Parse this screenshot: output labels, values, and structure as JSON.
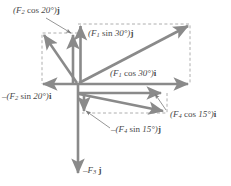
{
  "figure": {
    "colors": {
      "vector": "#8a8a8a",
      "dashed": "#9a9a9a",
      "text": "#4a4a4a",
      "background": "#ffffff"
    }
  },
  "labels": {
    "f2_cos20_j": "(F2 cos 20°)j",
    "f1_sin30_j": "(F1 sin 30°)j",
    "f1_cos30_i": "(F1 cos 30°)i",
    "f2_sin20_i": "–(F2 sin 20°)i",
    "f4_cos15_i": "(F4 cos 15°)i",
    "f4_sin15_j": "–(F4 sin 15°)j",
    "f3_j": "–F3 j"
  },
  "chart_data": {
    "type": "diagram",
    "origin": {
      "x": 78,
      "y": 84
    },
    "vectors": [
      {
        "name": "F1",
        "angle_deg": 30,
        "quadrant": "upper-right",
        "tip": {
          "x": 190,
          "y": 24
        },
        "components": [
          {
            "label": "(F1 cos 30°)i",
            "axis": "i",
            "sign": "+",
            "tip": {
              "x": 190,
              "y": 84
            }
          },
          {
            "label": "(F1 sin 30°)j",
            "axis": "j",
            "sign": "+",
            "tip": {
              "x": 78,
              "y": 24
            }
          }
        ]
      },
      {
        "name": "F2",
        "angle_deg": 20,
        "quadrant": "upper-left",
        "tip": {
          "x": 42,
          "y": 33
        },
        "components": [
          {
            "label": "–(F2 sin 20°)i",
            "axis": "i",
            "sign": "-",
            "tip": {
              "x": 41,
              "y": 84
            }
          },
          {
            "label": "(F2 cos 20°)j",
            "axis": "j",
            "sign": "+",
            "tip": {
              "x": 72,
              "y": 33
            }
          }
        ]
      },
      {
        "name": "F3",
        "quadrant": "down",
        "tip": {
          "x": 78,
          "y": 175
        },
        "components": [
          {
            "label": "–F3 j",
            "axis": "j",
            "sign": "-",
            "tip": {
              "x": 78,
              "y": 175
            }
          }
        ]
      },
      {
        "name": "F4",
        "angle_deg": 15,
        "quadrant": "lower-right",
        "tip": {
          "x": 165,
          "y": 112
        },
        "components": [
          {
            "label": "(F4 cos 15°)i",
            "axis": "i",
            "sign": "+",
            "tip": {
              "x": 163,
              "y": 93
            }
          },
          {
            "label": "–(F4 sin 15°)j",
            "axis": "j",
            "sign": "-",
            "tip": {
              "x": 84,
              "y": 113
            }
          }
        ]
      }
    ],
    "dashed_boxes": [
      {
        "for": "F1",
        "x1": 78,
        "y1": 24,
        "x2": 190,
        "y2": 84
      },
      {
        "for": "F2",
        "x1": 42,
        "y1": 33,
        "x2": 78,
        "y2": 84
      },
      {
        "for": "F4",
        "x1": 78,
        "y1": 93,
        "x2": 167,
        "y2": 113
      }
    ]
  }
}
